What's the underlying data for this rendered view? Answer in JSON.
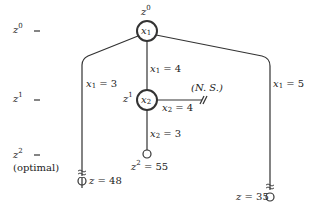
{
  "levels": [
    {
      "var": "z",
      "sup": "0",
      "suffix": ""
    },
    {
      "var": "z",
      "sup": "1",
      "suffix": ""
    },
    {
      "var": "z",
      "sup": "2",
      "suffix": "(optimal)"
    }
  ],
  "root": {
    "label_var": "z",
    "label_sup": "0",
    "node_var": "x",
    "node_sub": "1"
  },
  "node2": {
    "label_var": "z",
    "label_sup": "1",
    "node_var": "x",
    "node_sub": "2"
  },
  "edges": {
    "left": {
      "var": "x",
      "sub": "1",
      "rest": " = 3"
    },
    "mid": {
      "var": "x",
      "sub": "1",
      "rest": " = 4"
    },
    "right": {
      "var": "x",
      "sub": "1",
      "rest": " = 5"
    },
    "ns": {
      "var": "x",
      "sub": "2",
      "rest": " = 4"
    },
    "down": {
      "var": "x",
      "sub": "2",
      "rest": " = 3"
    }
  },
  "ns_label": "(N. S.)",
  "leaves": {
    "left": {
      "var": "z",
      "rest": " = 48"
    },
    "mid": {
      "var": "z",
      "sup": "2",
      "rest": " = 55"
    },
    "right": {
      "var": "z",
      "rest": " = 35"
    }
  },
  "colors": {
    "line": "#333333"
  }
}
